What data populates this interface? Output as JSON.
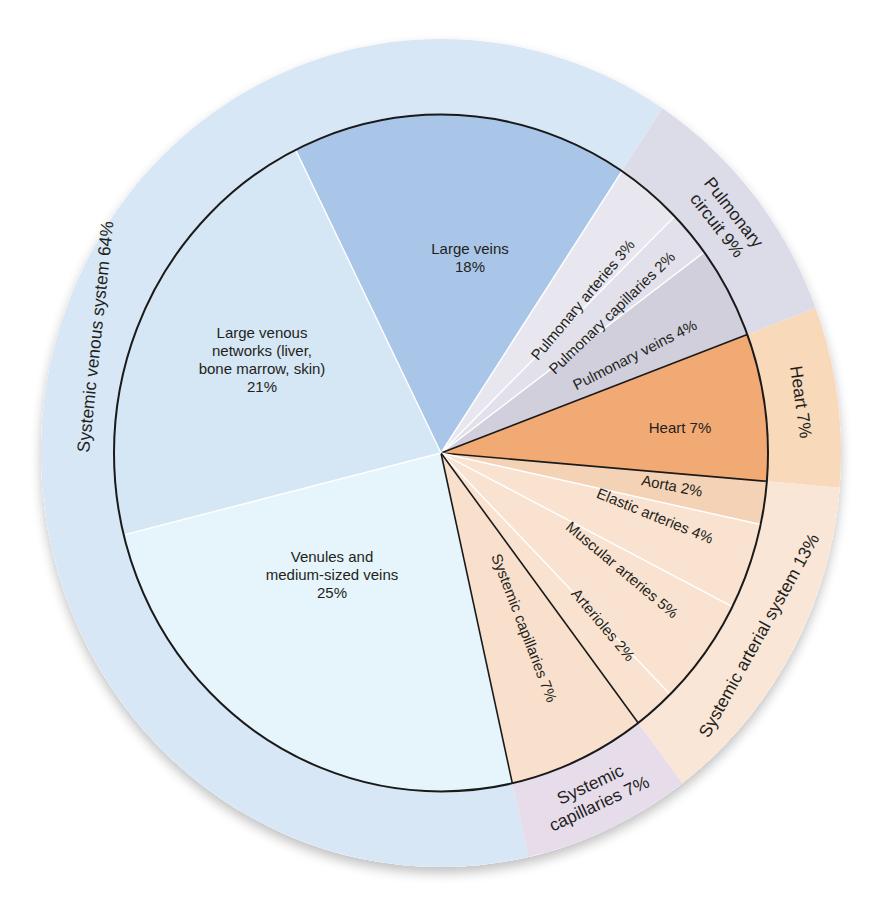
{
  "chart_data": {
    "type": "pie",
    "title": "",
    "center": [
      441,
      453
    ],
    "inner_radius": 327,
    "outer_radius": 400,
    "y_scale": 1.035,
    "angle_convention": "degrees clockwise from 12 o'clock",
    "slices": [
      {
        "id": "large-veins",
        "lines": [
          "Large veins",
          "18%"
        ],
        "value": 18,
        "start": 333.6,
        "end": 393.6,
        "color": "#a9c6e8",
        "border_after": "white",
        "label_pos": [
          470,
          258
        ],
        "label_rot": 0,
        "group": "systemic-venous"
      },
      {
        "id": "pulmonary-arteries",
        "lines": [
          "Pulmonary arteries 3%"
        ],
        "value": 3,
        "start": 33.6,
        "end": 45.6,
        "color": "#e8e6ef",
        "border_after": "white",
        "label_pos": [
          583,
          300
        ],
        "label_rot": -50,
        "group": "pulmonary"
      },
      {
        "id": "pulmonary-capillaries",
        "lines": [
          "Pulmonary capillaries 2%"
        ],
        "value": 2,
        "start": 45.6,
        "end": 53.6,
        "color": "#e2e0ea",
        "border_after": "white",
        "label_pos": [
          612,
          313
        ],
        "label_rot": -44,
        "group": "pulmonary"
      },
      {
        "id": "pulmonary-veins",
        "lines": [
          "Pulmonary veins 4%"
        ],
        "value": 4,
        "start": 53.6,
        "end": 69.5,
        "color": "#d1cfdc",
        "border_after": "black",
        "label_pos": [
          635,
          355
        ],
        "label_rot": -27,
        "group": "pulmonary"
      },
      {
        "id": "heart",
        "lines": [
          "Heart 7%"
        ],
        "value": 7,
        "start": 69.5,
        "end": 94.8,
        "color": "#f2aa74",
        "border_after": "black",
        "label_pos": [
          680,
          428
        ],
        "label_rot": 0,
        "group": "heart"
      },
      {
        "id": "aorta",
        "lines": [
          "Aorta 2%"
        ],
        "value": 2,
        "start": 94.8,
        "end": 102.2,
        "color": "#f4d2b6",
        "border_after": "white",
        "label_pos": [
          672,
          486
        ],
        "label_rot": 11,
        "group": "systemic-arterial"
      },
      {
        "id": "elastic-arteries",
        "lines": [
          "Elastic arteries 4%"
        ],
        "value": 4,
        "start": 102.2,
        "end": 117.0,
        "color": "#f9e2cf",
        "border_after": "white",
        "label_pos": [
          655,
          516
        ],
        "label_rot": 22,
        "group": "systemic-arterial"
      },
      {
        "id": "muscular-arteries",
        "lines": [
          "Muscular arteries 5%"
        ],
        "value": 5,
        "start": 117.0,
        "end": 135.5,
        "color": "#f9e3d0",
        "border_after": "white",
        "label_pos": [
          622,
          570
        ],
        "label_rot": 40,
        "group": "systemic-arterial"
      },
      {
        "id": "arterioles",
        "lines": [
          "Arterioles 2%"
        ],
        "value": 2,
        "start": 135.5,
        "end": 142.9,
        "color": "#f9e3d0",
        "border_after": "black",
        "label_pos": [
          603,
          625
        ],
        "label_rot": 50,
        "group": "systemic-arterial"
      },
      {
        "id": "systemic-capillaries",
        "lines": [
          "Systemic capillaries 7%"
        ],
        "value": 7,
        "start": 142.9,
        "end": 167.4,
        "color": "#f8e0cc",
        "border_after": "black",
        "label_pos": [
          524,
          628
        ],
        "label_rot": 69,
        "group": "systemic-capillaries"
      },
      {
        "id": "venules",
        "lines": [
          "Venules and",
          "medium-sized veins",
          "25%"
        ],
        "value": 25,
        "start": 167.4,
        "end": 256,
        "color": "#e6f5fb",
        "border_after": "white",
        "label_pos": [
          332,
          575
        ],
        "label_rot": 0,
        "group": "systemic-venous"
      },
      {
        "id": "large-venous-networks",
        "lines": [
          "Large venous",
          "networks (liver,",
          "bone marrow, skin)",
          "21%"
        ],
        "value": 21,
        "start": 256,
        "end": 333.6,
        "color": "#d5e6f4",
        "border_after": "white",
        "label_pos": [
          262,
          360
        ],
        "label_rot": 0,
        "group": "systemic-venous"
      }
    ],
    "groups": [
      {
        "id": "systemic-venous",
        "lines": [
          "Systemic venous system 64%"
        ],
        "value": 64,
        "start": 167.4,
        "end": 393.6,
        "color": "#d8e7f5",
        "label_angle": 288,
        "label_rot": -84
      },
      {
        "id": "pulmonary",
        "lines": [
          "Pulmonary",
          "circuit 9%"
        ],
        "value": 9,
        "start": 33.6,
        "end": 69.5,
        "color": "#dcdbe8",
        "label_angle": 51.5,
        "label_rot": 52
      },
      {
        "id": "heart",
        "lines": [
          "Heart 7%"
        ],
        "value": 7,
        "start": 69.5,
        "end": 94.8,
        "color": "#f8d9b9",
        "label_angle": 82.2,
        "label_rot": 82
      },
      {
        "id": "systemic-arterial",
        "lines": [
          "Systemic arterial system 13%"
        ],
        "value": 13,
        "start": 94.8,
        "end": 142.9,
        "color": "#fae6d6",
        "label_angle": 119,
        "label_rot": -61
      },
      {
        "id": "systemic-capillaries",
        "lines": [
          "Systemic",
          "capillaries 7%"
        ],
        "value": 7,
        "start": 142.9,
        "end": 167.4,
        "color": "#e6dcea",
        "label_angle": 155,
        "label_rot": -25
      }
    ]
  }
}
